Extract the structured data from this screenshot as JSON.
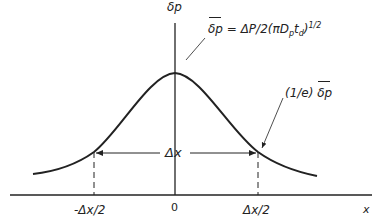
{
  "figure": {
    "y_axis_label": "δp",
    "x_axis_label": "x",
    "peak_label_hat": "δp",
    "peak_label_eq": " = ΔP/2(πD",
    "peak_label_sub1": "p",
    "peak_label_t": "t",
    "peak_label_sub2": "d",
    "peak_label_close": ")",
    "peak_label_sup": "1/2",
    "width_point_label_prefix": "(1/e) ",
    "width_point_label_hat": "δp",
    "width_label": "Δx",
    "tick_left": "-Δx/2",
    "tick_center": "0",
    "tick_right": "Δx/2"
  }
}
